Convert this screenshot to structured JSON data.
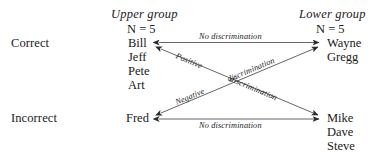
{
  "diagram": {
    "row_labels": [
      {
        "id": "correct",
        "text": "Correct"
      },
      {
        "id": "incorrect",
        "text": "Incorrect"
      }
    ],
    "columns": [
      {
        "id": "upper",
        "heading": "Upper group",
        "n_label": "N = 5",
        "correct_members": [
          "Bill",
          "Jeff",
          "Pete",
          "Art"
        ],
        "incorrect_members": [
          "Fred"
        ]
      },
      {
        "id": "lower",
        "heading": "Lower group",
        "n_label": "N = 5",
        "correct_members": [
          "Wayne",
          "Gregg"
        ],
        "incorrect_members": [
          "Mike",
          "Dave",
          "Steve"
        ]
      }
    ],
    "edges": [
      {
        "id": "top-no-discrimination",
        "label": "No discrimination",
        "from": "upper-correct",
        "to": "lower-correct",
        "arrows": "both"
      },
      {
        "id": "bottom-no-discrimination",
        "label": "No discrimination",
        "from": "upper-incorrect",
        "to": "lower-incorrect",
        "arrows": "both"
      },
      {
        "id": "positive-discrimination",
        "label_part1": "Positive",
        "label_part2": "discrimination",
        "label": "Positive discrimination",
        "from": "lower-incorrect",
        "to": "upper-correct",
        "arrows": "both"
      },
      {
        "id": "negative-discrimination",
        "label_part1": "Negative",
        "label_part2": "discrimination",
        "label": "Negative discrimination",
        "from": "upper-incorrect",
        "to": "lower-correct",
        "arrows": "both"
      }
    ],
    "colors": {
      "ink": "#1a1a1a",
      "line": "#4a4a4a",
      "background": "#ffffff"
    }
  }
}
